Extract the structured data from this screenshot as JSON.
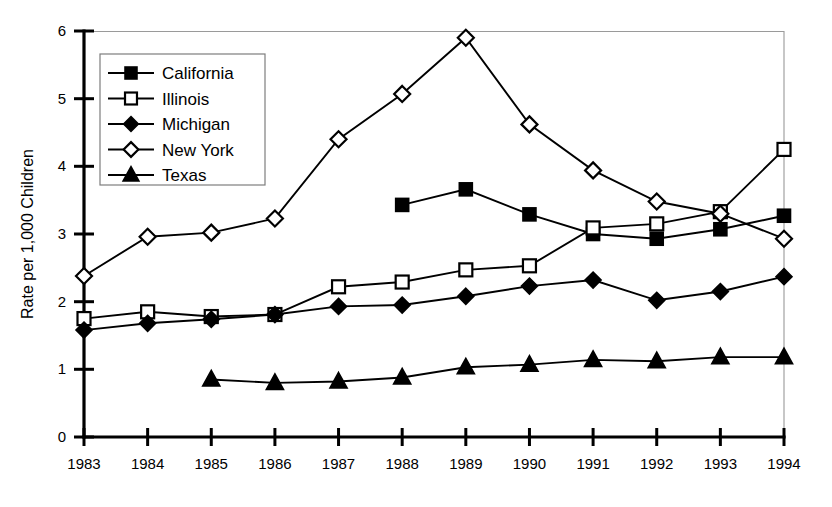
{
  "chart_data": {
    "type": "line",
    "title": "",
    "xlabel": "",
    "ylabel": "Rate per 1,000 Children",
    "x": [
      1983,
      1984,
      1985,
      1986,
      1987,
      1988,
      1989,
      1990,
      1991,
      1992,
      1993,
      1994
    ],
    "xticklabels": [
      "1983",
      "1984",
      "1985",
      "1986",
      "1987",
      "1988",
      "1989",
      "1990",
      "1991",
      "1992",
      "1993",
      "1994"
    ],
    "yticklabels": [
      "0",
      "1",
      "2",
      "3",
      "4",
      "5",
      "6"
    ],
    "yticks": [
      0,
      1,
      2,
      3,
      4,
      5,
      6
    ],
    "ylim": [
      0,
      6
    ],
    "xlim": [
      1983,
      1994
    ],
    "grid": false,
    "legend_position": "upper-left-inside",
    "series": [
      {
        "name": "California",
        "marker": "filled-square",
        "x": [
          1988,
          1989,
          1990,
          1991,
          1992,
          1993,
          1994
        ],
        "values": [
          3.43,
          3.66,
          3.29,
          3.0,
          2.93,
          3.07,
          3.27
        ]
      },
      {
        "name": "Illinois",
        "marker": "open-square",
        "x": [
          1983,
          1984,
          1985,
          1986,
          1987,
          1988,
          1989,
          1990,
          1991,
          1992,
          1993,
          1994
        ],
        "values": [
          1.75,
          1.85,
          1.78,
          1.81,
          2.22,
          2.29,
          2.47,
          2.53,
          3.09,
          3.15,
          3.33,
          4.25
        ]
      },
      {
        "name": "Michigan",
        "marker": "filled-diamond",
        "x": [
          1983,
          1984,
          1985,
          1986,
          1987,
          1988,
          1989,
          1990,
          1991,
          1992,
          1993,
          1994
        ],
        "values": [
          1.58,
          1.68,
          1.74,
          1.81,
          1.93,
          1.95,
          2.08,
          2.23,
          2.32,
          2.02,
          2.15,
          2.37
        ]
      },
      {
        "name": "New York",
        "marker": "open-diamond",
        "x": [
          1983,
          1984,
          1985,
          1986,
          1987,
          1988,
          1989,
          1990,
          1991,
          1992,
          1993,
          1994
        ],
        "values": [
          2.38,
          2.96,
          3.02,
          3.23,
          4.4,
          5.07,
          5.9,
          4.62,
          3.94,
          3.48,
          3.3,
          2.93
        ]
      },
      {
        "name": "Texas",
        "marker": "filled-triangle",
        "x": [
          1985,
          1986,
          1987,
          1988,
          1989,
          1990,
          1991,
          1992,
          1993,
          1994
        ],
        "values": [
          0.85,
          0.8,
          0.82,
          0.88,
          1.03,
          1.07,
          1.14,
          1.12,
          1.18,
          1.18
        ]
      }
    ]
  },
  "legend": {
    "entries": [
      {
        "label": "California",
        "marker": "filled-square"
      },
      {
        "label": "Illinois",
        "marker": "open-square"
      },
      {
        "label": "Michigan",
        "marker": "filled-diamond"
      },
      {
        "label": "New York",
        "marker": "open-diamond"
      },
      {
        "label": "Texas",
        "marker": "filled-triangle"
      }
    ]
  },
  "colors": {
    "ink": "#000000",
    "frame": "#9a9a9a",
    "background": "#ffffff"
  }
}
